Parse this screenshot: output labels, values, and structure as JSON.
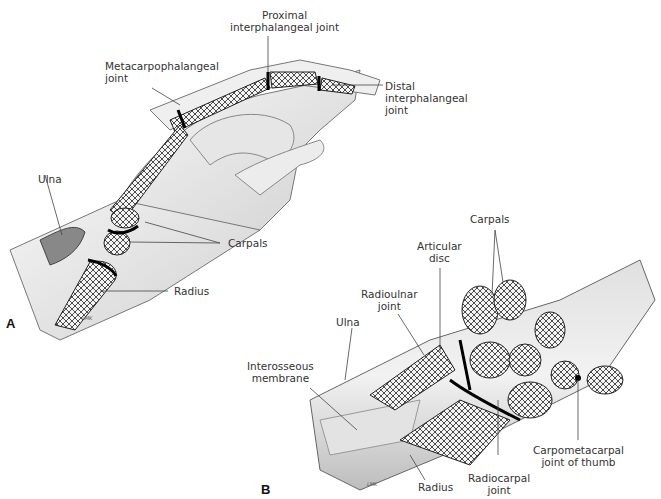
{
  "figure": {
    "panels": [
      {
        "id": "A",
        "label": "A",
        "description": "Hand and wrist in side view, showing bones of finger, carpals and radius",
        "labels": {
          "proximal_ip": [
            "Proximal",
            "interphalangeal joint"
          ],
          "mcp": [
            "Metacarpophalangeal",
            "joint"
          ],
          "distal_ip": [
            "Distal",
            "interphalangeal",
            "joint"
          ],
          "ulna": "Ulna",
          "carpals": "Carpals",
          "radius": "Radius"
        },
        "signature": "LMK"
      },
      {
        "id": "B",
        "label": "B",
        "description": "Coronal section of wrist showing carpal bones and joints",
        "labels": {
          "carpals": "Carpals",
          "articular_disc": [
            "Articular",
            "disc"
          ],
          "radioulnar": [
            "Radioulnar",
            "joint"
          ],
          "ulna": "Ulna",
          "interosseous": [
            "Interosseous",
            "membrane"
          ],
          "cmc_thumb": [
            "Carpometacarpal",
            "joint of thumb"
          ],
          "radiocarpal": [
            "Radiocarpal",
            "joint"
          ],
          "radius": "Radius"
        },
        "signature": "LMK"
      }
    ],
    "colors": {
      "skin": "#eeeeee",
      "skin_shade": "#cfcfcf",
      "bone": "#f4f4f4",
      "bone_texture": "#3a3a3a",
      "joint": "#111111",
      "leader": "#444444"
    }
  }
}
